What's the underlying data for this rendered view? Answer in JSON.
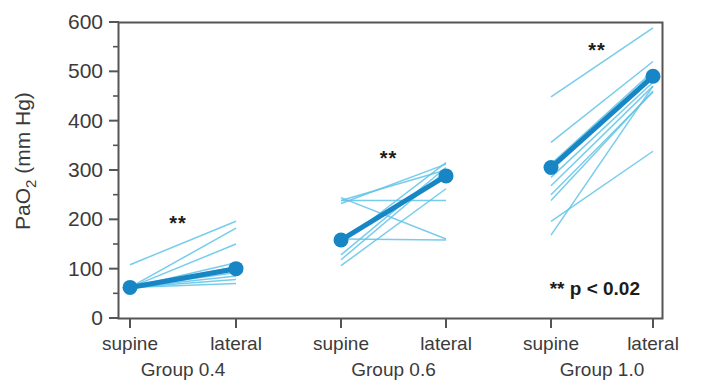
{
  "chart_data": {
    "type": "line",
    "title": "",
    "xlabel": "",
    "ylabel": "PaO2 (mm Hg)",
    "ylabel_main": "PaO",
    "ylabel_sub": "2",
    "ylabel_unit": " (mm Hg)",
    "ylim": [
      0,
      600
    ],
    "ytick_values": [
      0,
      100,
      200,
      300,
      400,
      500,
      600
    ],
    "ytick_labels": [
      "0",
      "100",
      "200",
      "300",
      "400",
      "500",
      "600"
    ],
    "yminor_values": [
      50,
      150,
      250,
      350,
      450,
      550
    ],
    "grid": false,
    "legend": "none",
    "x_categories": [
      "supine",
      "lateral",
      "supine",
      "lateral",
      "supine",
      "lateral"
    ],
    "groups": [
      {
        "name": "Group 0.4",
        "label": "Group 0.4",
        "x_labels": [
          "supine",
          "lateral"
        ],
        "significance": "**",
        "mean": {
          "supine": 62,
          "lateral": 100
        },
        "subjects": [
          {
            "supine": 62,
            "lateral": 70
          },
          {
            "supine": 62,
            "lateral": 78
          },
          {
            "supine": 62,
            "lateral": 85
          },
          {
            "supine": 62,
            "lateral": 92
          },
          {
            "supine": 62,
            "lateral": 97
          },
          {
            "supine": 62,
            "lateral": 104
          },
          {
            "supine": 62,
            "lateral": 112
          },
          {
            "supine": 62,
            "lateral": 150
          },
          {
            "supine": 62,
            "lateral": 182
          },
          {
            "supine": 108,
            "lateral": 196
          }
        ]
      },
      {
        "name": "Group 0.6",
        "label": "Group 0.6",
        "x_labels": [
          "supine",
          "lateral"
        ],
        "significance": "**",
        "mean": {
          "supine": 158,
          "lateral": 288
        },
        "subjects": [
          {
            "supine": 160,
            "lateral": 158
          },
          {
            "supine": 238,
            "lateral": 238
          },
          {
            "supine": 238,
            "lateral": 300
          },
          {
            "supine": 232,
            "lateral": 312
          },
          {
            "supine": 128,
            "lateral": 305
          },
          {
            "supine": 118,
            "lateral": 298
          },
          {
            "supine": 106,
            "lateral": 262
          },
          {
            "supine": 152,
            "lateral": 315
          },
          {
            "supine": 244,
            "lateral": 160
          }
        ]
      },
      {
        "name": "Group 1.0",
        "label": "Group 1.0",
        "x_labels": [
          "supine",
          "lateral"
        ],
        "significance": "**",
        "mean": {
          "supine": 305,
          "lateral": 490
        },
        "subjects": [
          {
            "supine": 448,
            "lateral": 588
          },
          {
            "supine": 356,
            "lateral": 520
          },
          {
            "supine": 312,
            "lateral": 500
          },
          {
            "supine": 300,
            "lateral": 496
          },
          {
            "supine": 285,
            "lateral": 478
          },
          {
            "supine": 268,
            "lateral": 470
          },
          {
            "supine": 250,
            "lateral": 458
          },
          {
            "supine": 196,
            "lateral": 338
          },
          {
            "supine": 168,
            "lateral": 470
          },
          {
            "supine": 238,
            "lateral": 460
          }
        ]
      }
    ],
    "annotations": [
      {
        "name": "p-value-note",
        "text": "** p < 0.02"
      }
    ],
    "colors": {
      "marker": "#1886c4",
      "mean_line": "#1886c4",
      "subject_line": "#5fc3e8",
      "axis": "#555555",
      "text": "#3b3b3b"
    }
  },
  "axis": {
    "y_title_main": "PaO",
    "y_title_sub": "2",
    "y_title_unit": " (mm Hg)"
  },
  "note": {
    "p_value": "** p < 0.02"
  }
}
